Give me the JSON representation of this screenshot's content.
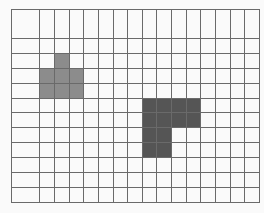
{
  "grid": {
    "cols": 17,
    "rows": 13,
    "origin_x": 11,
    "origin_y": 9,
    "width": 249,
    "height": 194,
    "background": "#fafafa",
    "line_color": "#6a6a6a"
  },
  "colors": {
    "light": "#8c8c8c",
    "dark": "#555555"
  },
  "filled_cells": [
    {
      "col": 3,
      "row": 3,
      "color": "light"
    },
    {
      "col": 2,
      "row": 4,
      "color": "light"
    },
    {
      "col": 3,
      "row": 4,
      "color": "light"
    },
    {
      "col": 4,
      "row": 4,
      "color": "light"
    },
    {
      "col": 2,
      "row": 5,
      "color": "light"
    },
    {
      "col": 3,
      "row": 5,
      "color": "light"
    },
    {
      "col": 4,
      "row": 5,
      "color": "light"
    },
    {
      "col": 9,
      "row": 6,
      "color": "dark"
    },
    {
      "col": 10,
      "row": 6,
      "color": "dark"
    },
    {
      "col": 11,
      "row": 6,
      "color": "dark"
    },
    {
      "col": 12,
      "row": 6,
      "color": "dark"
    },
    {
      "col": 9,
      "row": 7,
      "color": "dark"
    },
    {
      "col": 10,
      "row": 7,
      "color": "dark"
    },
    {
      "col": 11,
      "row": 7,
      "color": "dark"
    },
    {
      "col": 12,
      "row": 7,
      "color": "dark"
    },
    {
      "col": 9,
      "row": 8,
      "color": "dark"
    },
    {
      "col": 10,
      "row": 8,
      "color": "dark"
    },
    {
      "col": 9,
      "row": 9,
      "color": "dark"
    },
    {
      "col": 10,
      "row": 9,
      "color": "dark"
    }
  ]
}
